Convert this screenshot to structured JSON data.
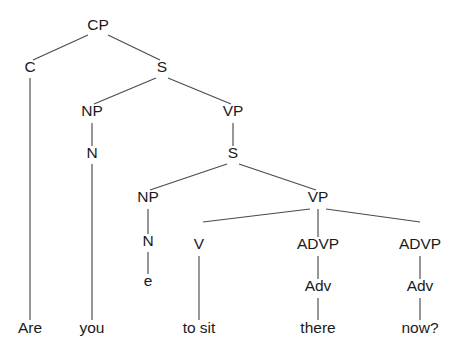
{
  "diagram": {
    "type": "syntax-tree",
    "sentence": "Are you to sit there now?",
    "background_color": "#ffffff",
    "line_color": "#4a4a4a",
    "text_color": "#1a1a1a",
    "width": 466,
    "height": 357
  },
  "nodes": [
    {
      "id": "CP",
      "label": "CP",
      "x": 98,
      "y": 30,
      "kind": "phrase"
    },
    {
      "id": "C",
      "label": "C",
      "x": 30,
      "y": 72,
      "kind": "head"
    },
    {
      "id": "S1",
      "label": "S",
      "x": 162,
      "y": 72,
      "kind": "phrase"
    },
    {
      "id": "NP1",
      "label": "NP",
      "x": 92,
      "y": 116,
      "kind": "phrase"
    },
    {
      "id": "VP1",
      "label": "VP",
      "x": 233,
      "y": 116,
      "kind": "phrase"
    },
    {
      "id": "N1",
      "label": "N",
      "x": 92,
      "y": 158,
      "kind": "head"
    },
    {
      "id": "S2",
      "label": "S",
      "x": 233,
      "y": 158,
      "kind": "phrase"
    },
    {
      "id": "NP2",
      "label": "NP",
      "x": 148,
      "y": 202,
      "kind": "phrase"
    },
    {
      "id": "VP2",
      "label": "VP",
      "x": 318,
      "y": 202,
      "kind": "phrase"
    },
    {
      "id": "N2",
      "label": "N",
      "x": 148,
      "y": 246,
      "kind": "head"
    },
    {
      "id": "V",
      "label": "V",
      "x": 199,
      "y": 249,
      "kind": "head"
    },
    {
      "id": "ADVP1",
      "label": "ADVP",
      "x": 318,
      "y": 249,
      "kind": "phrase"
    },
    {
      "id": "ADVP2",
      "label": "ADVP",
      "x": 420,
      "y": 249,
      "kind": "phrase"
    },
    {
      "id": "EMPTY",
      "label": "e",
      "x": 148,
      "y": 286,
      "kind": "empty-category"
    },
    {
      "id": "ADV1",
      "label": "Adv",
      "x": 318,
      "y": 291,
      "kind": "head"
    },
    {
      "id": "ADV2",
      "label": "Adv",
      "x": 420,
      "y": 291,
      "kind": "head"
    }
  ],
  "terminals": [
    {
      "id": "T_ARE",
      "label": "Are",
      "x": 30,
      "y": 333,
      "parent": "C"
    },
    {
      "id": "T_YOU",
      "label": "you",
      "x": 92,
      "y": 333,
      "parent": "N1"
    },
    {
      "id": "T_TOSIT",
      "label": "to sit",
      "x": 199,
      "y": 333,
      "parent": "V"
    },
    {
      "id": "T_THERE",
      "label": "there",
      "x": 318,
      "y": 333,
      "parent": "ADV1"
    },
    {
      "id": "T_NOW",
      "label": "now?",
      "x": 420,
      "y": 333,
      "parent": "ADV2"
    }
  ],
  "edges": [
    {
      "from": "CP",
      "to": "C",
      "x1": 88,
      "y1": 35,
      "x2": 33,
      "y2": 60
    },
    {
      "from": "CP",
      "to": "S1",
      "x1": 108,
      "y1": 35,
      "x2": 160,
      "y2": 60
    },
    {
      "from": "C",
      "to": "T_ARE",
      "x1": 30,
      "y1": 78,
      "x2": 30,
      "y2": 320
    },
    {
      "from": "S1",
      "to": "NP1",
      "x1": 156,
      "y1": 78,
      "x2": 94,
      "y2": 104
    },
    {
      "from": "S1",
      "to": "VP1",
      "x1": 168,
      "y1": 78,
      "x2": 231,
      "y2": 104
    },
    {
      "from": "NP1",
      "to": "N1",
      "x1": 92,
      "y1": 123,
      "x2": 92,
      "y2": 146
    },
    {
      "from": "VP1",
      "to": "S2",
      "x1": 233,
      "y1": 123,
      "x2": 233,
      "y2": 146
    },
    {
      "from": "N1",
      "to": "T_YOU",
      "x1": 92,
      "y1": 164,
      "x2": 92,
      "y2": 320
    },
    {
      "from": "S2",
      "to": "NP2",
      "x1": 227,
      "y1": 164,
      "x2": 150,
      "y2": 190
    },
    {
      "from": "S2",
      "to": "VP2",
      "x1": 239,
      "y1": 164,
      "x2": 316,
      "y2": 190
    },
    {
      "from": "NP2",
      "to": "N2",
      "x1": 148,
      "y1": 209,
      "x2": 148,
      "y2": 234
    },
    {
      "from": "VP2",
      "to": "V",
      "x1": 310,
      "y1": 209,
      "x2": 203,
      "y2": 222
    },
    {
      "from": "VP2",
      "to": "ADVP1",
      "x1": 318,
      "y1": 209,
      "x2": 318,
      "y2": 237
    },
    {
      "from": "VP2",
      "to": "ADVP2",
      "x1": 326,
      "y1": 209,
      "x2": 420,
      "y2": 222
    },
    {
      "from": "N2",
      "to": "EMPTY",
      "x1": 148,
      "y1": 252,
      "x2": 148,
      "y2": 274
    },
    {
      "from": "V",
      "to": "T_TOSIT",
      "x1": 199,
      "y1": 256,
      "x2": 199,
      "y2": 320
    },
    {
      "from": "ADVP1",
      "to": "ADV1",
      "x1": 318,
      "y1": 256,
      "x2": 318,
      "y2": 279
    },
    {
      "from": "ADVP2",
      "to": "ADV2",
      "x1": 420,
      "y1": 256,
      "x2": 420,
      "y2": 279
    },
    {
      "from": "ADV1",
      "to": "T_THERE",
      "x1": 318,
      "y1": 298,
      "x2": 318,
      "y2": 320
    },
    {
      "from": "ADV2",
      "to": "T_NOW",
      "x1": 420,
      "y1": 298,
      "x2": 420,
      "y2": 320
    }
  ]
}
